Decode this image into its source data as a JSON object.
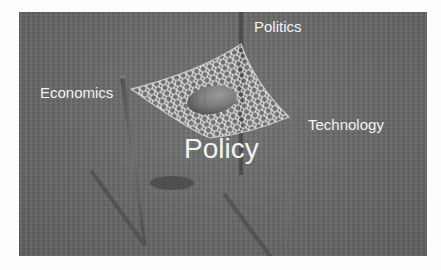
{
  "diagram": {
    "labels": {
      "top": "Politics",
      "left": "Economics",
      "right": "Technology",
      "center": "Policy"
    },
    "elements": {
      "net": "net-hammock",
      "ball": "ball",
      "poles": [
        "left-pole",
        "back-pole",
        "right-pole"
      ]
    },
    "colors": {
      "background": "#6b6b6b",
      "label": "#f2f2f2",
      "net": "#e8e8e8",
      "ball": "#8a8a8a",
      "pole": "#595959",
      "shadow": "#4a4a4a"
    }
  }
}
